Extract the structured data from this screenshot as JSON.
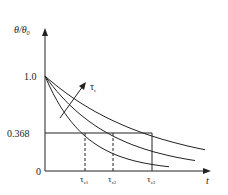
{
  "chart_data": {
    "type": "line",
    "title": "",
    "xlabel": "t",
    "ylabel": "θ/θ₀",
    "yticks": [
      "0",
      "0.368",
      "1.0"
    ],
    "xticks": [
      "τc1",
      "τc2",
      "τc3"
    ],
    "annotation": "τc",
    "annotation_note": "arrow indicates increasing τc",
    "series": [
      {
        "name": "τc1",
        "function": "exp(-t/τc1)",
        "tau": 1.0
      },
      {
        "name": "τc2",
        "function": "exp(-t/τc2)",
        "tau": 1.7
      },
      {
        "name": "τc3",
        "function": "exp(-t/τc3)",
        "tau": 2.7
      }
    ],
    "reference_line_y": 0.368,
    "ylim": [
      0,
      1.2
    ],
    "grid": false,
    "legend": "none"
  },
  "labels": {
    "ylabel": "θ/θ",
    "ylabel_sub": "0",
    "xlabel": "t",
    "y_one": "1.0",
    "y_ref": "0.368",
    "y_zero": "0",
    "tau": "τ",
    "tau_c_sub": "c",
    "tc1_sub": "c1",
    "tc2_sub": "c2",
    "tc3_sub": "c3"
  }
}
